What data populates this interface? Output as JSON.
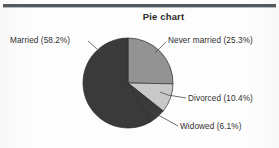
{
  "chart_data": {
    "type": "pie",
    "title": "Pie chart",
    "xlabel": "",
    "ylabel": "",
    "legend_position": "callout-labels",
    "grid": false,
    "start_angle_deg": 0,
    "direction": "clockwise",
    "categories": [
      "Never married",
      "Divorced",
      "Widowed",
      "Married"
    ],
    "values": [
      25.3,
      10.4,
      6.1,
      58.2
    ],
    "units": "percent",
    "slices": [
      {
        "name": "Never married",
        "value": 25.3,
        "label": "Never married (25.3%)",
        "color": "#939393",
        "start_deg": 0,
        "end_deg": 91.08
      },
      {
        "name": "Divorced",
        "value": 10.4,
        "label": "Divorced (10.4%)",
        "color": "#c9c9c9",
        "start_deg": 91.08,
        "end_deg": 128.52
      },
      {
        "name": "Widowed",
        "value": 6.1,
        "label": "Widowed (6.1%)",
        "color": "#3a3a3a",
        "start_deg": 128.52,
        "end_deg": 150.48
      },
      {
        "name": "Married",
        "value": 58.2,
        "label": "Married (58.2%)",
        "color": "#3a3a3a",
        "start_deg": 150.48,
        "end_deg": 360.0
      }
    ]
  },
  "labels": {
    "married": "Married (58.2%)",
    "never_married": "Never married (25.3%)",
    "divorced": "Divorced (10.4%)",
    "widowed": "Widowed (6.1%)"
  },
  "colors": {
    "never_married": "#939393",
    "divorced": "#c9c9c9",
    "widowed": "#3a3a3a",
    "married": "#3a3a3a",
    "outline": "#2b2b2b",
    "rule": "#555a5e",
    "text": "#2e2e2e",
    "background": "#fdfdfd"
  }
}
